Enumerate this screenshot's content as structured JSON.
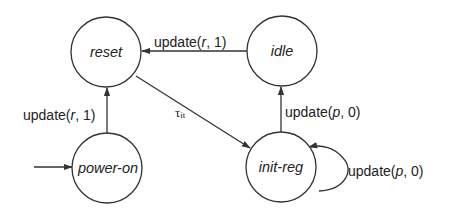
{
  "diagram": {
    "type": "state-machine",
    "colors": {
      "stroke": "#333333",
      "text": "#222222",
      "background": "#ffffff"
    },
    "states": [
      {
        "id": "reset",
        "label": "reset",
        "cx": 106,
        "cy": 52,
        "r": 35
      },
      {
        "id": "idle",
        "label": "idle",
        "cx": 282,
        "cy": 51,
        "r": 35
      },
      {
        "id": "power-on",
        "label": "power-on",
        "cx": 107,
        "cy": 168,
        "r": 35,
        "initial": true
      },
      {
        "id": "init-reg",
        "label": "init-reg",
        "cx": 281,
        "cy": 167,
        "r": 35
      }
    ],
    "transitions": [
      {
        "from": "idle",
        "to": "reset",
        "label_prefix": "update(",
        "label_var": "r",
        "label_suffix": ", 1)"
      },
      {
        "from": "power-on",
        "to": "reset",
        "label_prefix": "update(",
        "label_var": "r",
        "label_suffix": ", 1)"
      },
      {
        "from": "reset",
        "to": "init-reg",
        "label_tau": "τ",
        "label_sub": "it"
      },
      {
        "from": "init-reg",
        "to": "idle",
        "label_prefix": "update(",
        "label_var": "p",
        "label_suffix": ", 0)"
      },
      {
        "from": "init-reg",
        "to": "init-reg",
        "label_prefix": "update(",
        "label_var": "p",
        "label_suffix": ", 0)"
      }
    ]
  }
}
